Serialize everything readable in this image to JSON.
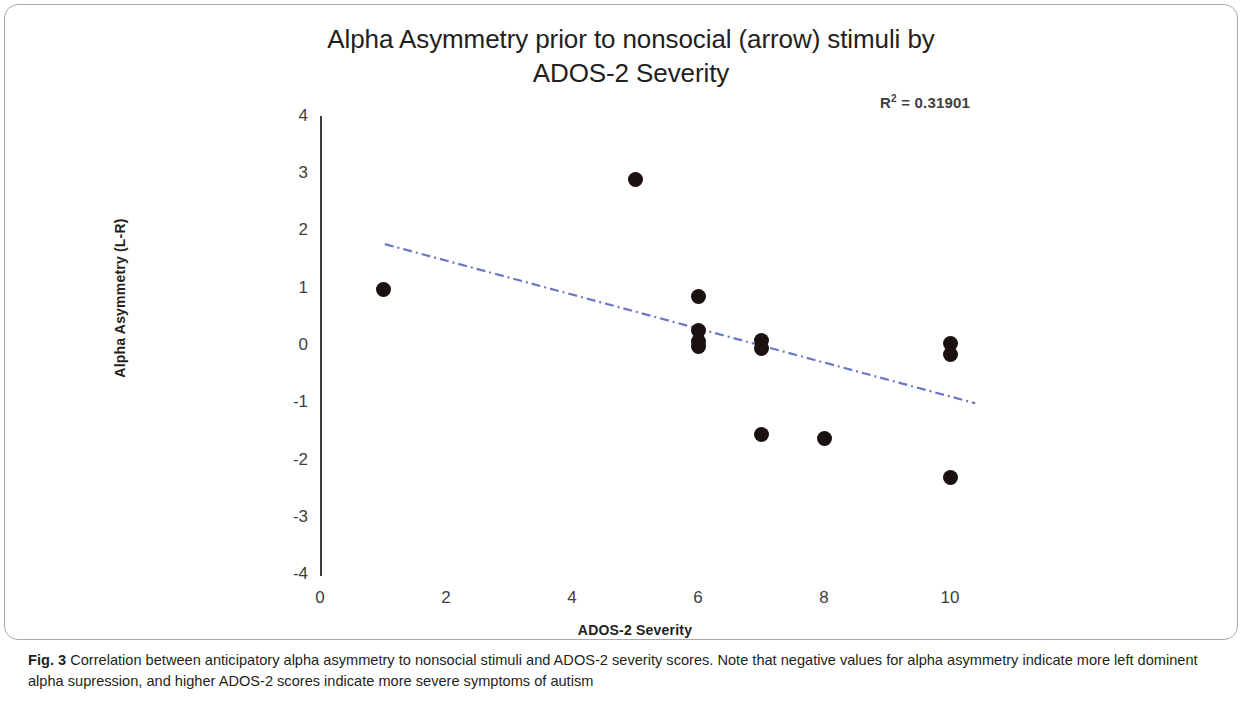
{
  "figure": {
    "title_line1": "Alpha Asymmetry prior to nonsocial (arrow) stimuli by",
    "title_line2": "ADOS-2 Severity",
    "r2_prefix": "R",
    "r2_sup": "2",
    "r2_value": " = 0.31901",
    "caption_label": "Fig. 3",
    "caption_text": " Correlation between anticipatory alpha asymmetry to nonsocial stimuli and ADOS-2 severity scores. Note that negative values for alpha asymmetry indicate more left dominent alpha supression, and higher ADOS-2 scores indicate more severe symptoms of autism"
  },
  "chart_data": {
    "type": "scatter",
    "title": "Alpha Asymmetry prior to nonsocial (arrow) stimuli by ADOS-2 Severity",
    "xlabel": "ADOS-2 Severity",
    "ylabel": "Alpha Asymmetry (L-R)",
    "xlim": [
      0,
      10.6
    ],
    "ylim": [
      -4,
      4
    ],
    "xticks": [
      0,
      2,
      4,
      6,
      8,
      10
    ],
    "xtick_labels": [
      "0",
      "2",
      "4",
      "6",
      "8",
      "10"
    ],
    "yticks": [
      4,
      3,
      2,
      1,
      0,
      -1,
      -2,
      -3,
      -4
    ],
    "ytick_labels": [
      "4",
      "3",
      "2",
      "1",
      "0",
      "-1",
      "-2",
      "-3",
      "-4"
    ],
    "grid": false,
    "legend": "none",
    "marker_color": "#1a1210",
    "marker_size_px": 15,
    "points": [
      {
        "x": 1,
        "y": 0.98
      },
      {
        "x": 5,
        "y": 2.9
      },
      {
        "x": 6,
        "y": 0.87
      },
      {
        "x": 6,
        "y": 0.27
      },
      {
        "x": 6,
        "y": 0.08
      },
      {
        "x": 6,
        "y": 0.0
      },
      {
        "x": 7,
        "y": 0.1
      },
      {
        "x": 7,
        "y": -0.05
      },
      {
        "x": 7,
        "y": -1.55
      },
      {
        "x": 8,
        "y": -1.62
      },
      {
        "x": 10,
        "y": 0.05
      },
      {
        "x": 10,
        "y": -0.15
      },
      {
        "x": 10,
        "y": -2.3
      }
    ],
    "trendline": {
      "style": "dash-dot",
      "color": "#6b77c4",
      "r_squared": 0.31901,
      "x_start": 1.03,
      "y_start": 1.78,
      "x_end": 10.4,
      "y_end": -1.0
    }
  },
  "axes": {
    "y_ticks": [
      {
        "label": "4",
        "px": 117
      },
      {
        "label": "3",
        "px": 174
      },
      {
        "label": "2",
        "px": 231
      },
      {
        "label": "1",
        "px": 289
      },
      {
        "label": "0",
        "px": 346
      },
      {
        "label": "-1",
        "px": 403
      },
      {
        "label": "-2",
        "px": 461
      },
      {
        "label": "-3",
        "px": 518
      },
      {
        "label": "-4",
        "px": 575
      }
    ],
    "x_ticks": [
      {
        "label": "0",
        "px": 320
      },
      {
        "label": "2",
        "px": 446
      },
      {
        "label": "4",
        "px": 572
      },
      {
        "label": "6",
        "px": 698
      },
      {
        "label": "8",
        "px": 824
      },
      {
        "label": "10",
        "px": 950
      }
    ]
  }
}
